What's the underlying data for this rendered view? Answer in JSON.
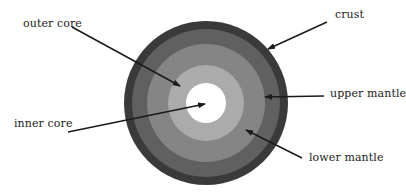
{
  "diagram": {
    "center": {
      "x": 206,
      "y": 103
    },
    "layers": [
      {
        "id": "crust",
        "label": "crust",
        "radius": 82,
        "color": "#3a3a3a"
      },
      {
        "id": "upper-mantle",
        "label": "upper mantle",
        "radius": 74,
        "color": "#5f5f5f"
      },
      {
        "id": "lower-mantle",
        "label": "lower mantle",
        "radius": 59,
        "color": "#858585"
      },
      {
        "id": "outer-core",
        "label": "outer core",
        "radius": 38,
        "color": "#ababab"
      },
      {
        "id": "inner-core",
        "label": "inner core",
        "radius": 20,
        "color": "#ffffff"
      }
    ],
    "labels": {
      "outer_core": "outer core",
      "inner_core": "inner core",
      "crust": "crust",
      "upper_mantle": "upper mantle",
      "lower_mantle": "lower mantle"
    },
    "arrow_color": "#1a1a1a"
  }
}
